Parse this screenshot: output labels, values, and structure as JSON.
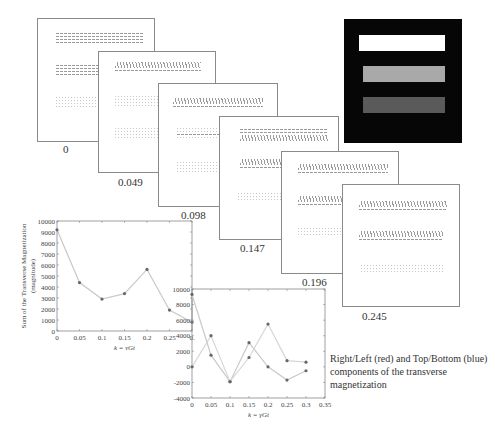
{
  "panels": [
    {
      "label": "0"
    },
    {
      "label": "0.049"
    },
    {
      "label": "0.098"
    },
    {
      "label": "0.147"
    },
    {
      "label": "0.196"
    },
    {
      "label": "0.245"
    }
  ],
  "phantom": {
    "bars": [
      {
        "shade": "white",
        "color": "#ffffff"
      },
      {
        "shade": "light-gray",
        "color": "#a9a9a9"
      },
      {
        "shade": "dark-gray",
        "color": "#5a5a5a"
      }
    ],
    "background": "#060606"
  },
  "caption": "Right/Left (red) and Top/Bottom (blue) components of the transverse magnetization",
  "chart_data": [
    {
      "type": "line",
      "title": "",
      "xlabel": "k = γGt",
      "ylabel": "Sum of the Transverse Magnetization (magnitude)",
      "x": [
        0,
        0.05,
        0.1,
        0.15,
        0.2,
        0.25,
        0.3
      ],
      "values": [
        9200,
        4400,
        2900,
        3400,
        5600,
        1900,
        800
      ],
      "xticks": [
        "0",
        "0.05",
        "0.1",
        "0.15",
        "0.2",
        "0.25",
        "0."
      ],
      "yticks": [
        "0",
        "1000",
        "2000",
        "3000",
        "4000",
        "5000",
        "6000",
        "7000",
        "8000",
        "9000",
        "10000"
      ],
      "xlim": [
        0,
        0.3
      ],
      "ylim": [
        0,
        10000
      ],
      "grid": false
    },
    {
      "type": "line",
      "title": "",
      "xlabel": "k = γGt",
      "ylabel": "",
      "x": [
        0,
        0.05,
        0.1,
        0.15,
        0.2,
        0.25,
        0.3
      ],
      "series": [
        {
          "name": "Right/Left (red)",
          "values": [
            9300,
            1500,
            -1900,
            3100,
            0,
            -1700,
            -500
          ]
        },
        {
          "name": "Top/Bottom (blue)",
          "values": [
            0,
            4000,
            -1900,
            1200,
            5500,
            800,
            600
          ]
        }
      ],
      "xticks": [
        "0",
        "0.05",
        "0.1",
        "0.15",
        "0.2",
        "0.25",
        "0.3",
        "0.35"
      ],
      "yticks": [
        "-4000",
        "-2000",
        "0",
        "2000",
        "4000",
        "6000",
        "8000",
        "10000"
      ],
      "xlim": [
        0,
        0.35
      ],
      "ylim": [
        -4000,
        10000
      ],
      "grid": false
    }
  ]
}
